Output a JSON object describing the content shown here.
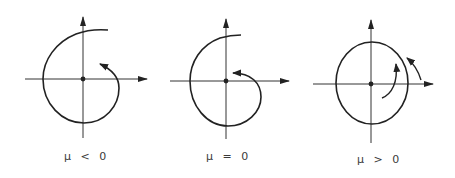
{
  "figure": {
    "stroke_color": "#222222",
    "background": "#ffffff"
  },
  "panels": [
    {
      "id": "mu-negative",
      "label": "μ < 0",
      "behavior": "stable spiral (inward)"
    },
    {
      "id": "mu-zero",
      "label": "μ = 0",
      "behavior": "weakly stable spiral (inward)"
    },
    {
      "id": "mu-positive",
      "label": "μ > 0",
      "behavior": "limit cycle with outward spiral inside and inward spiral outside"
    }
  ]
}
